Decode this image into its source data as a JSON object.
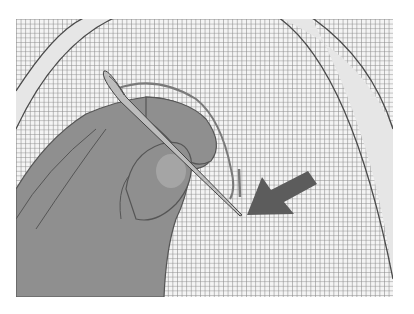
{
  "illustration": {
    "subject": "hand threading needle into embroidery fabric within hoop",
    "colors": {
      "background": "#ffffff",
      "grid_fill": "#f4f4f4",
      "grid_line": "#8a8a8a",
      "hoop_fill": "#e6e6e6",
      "hoop_outline": "#4a4a4a",
      "hand_fill": "#8f8f8f",
      "hand_outline": "#555555",
      "nail_fill": "#a5a5a5",
      "needle_fill": "#bdbdbd",
      "needle_outline": "#444444",
      "arrow_fill": "#5c5c5c",
      "thread": "#7a7a7a"
    },
    "grid_spacing_px": 4.6
  }
}
